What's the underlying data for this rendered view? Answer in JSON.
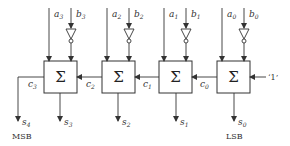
{
  "diagram": {
    "type": "4-bit ripple adder/subtractor (a + NOT b + 1)",
    "adders": [
      {
        "symbol": "Σ",
        "a": "a",
        "a_sub": "3",
        "b": "b",
        "b_sub": "3",
        "sum": "s",
        "sum_sub": "3",
        "carry_out": "c",
        "carry_out_sub": "3"
      },
      {
        "symbol": "Σ",
        "a": "a",
        "a_sub": "2",
        "b": "b",
        "b_sub": "2",
        "sum": "s",
        "sum_sub": "2",
        "carry_out": "c",
        "carry_out_sub": "2"
      },
      {
        "symbol": "Σ",
        "a": "a",
        "a_sub": "1",
        "b": "b",
        "b_sub": "1",
        "sum": "s",
        "sum_sub": "1",
        "carry_out": "c",
        "carry_out_sub": "1"
      },
      {
        "symbol": "Σ",
        "a": "a",
        "a_sub": "0",
        "b": "b",
        "b_sub": "0",
        "sum": "s",
        "sum_sub": "0",
        "carry_out": "c",
        "carry_out_sub": "0"
      }
    ],
    "carry_in": "‘1’",
    "final_output": {
      "name": "s",
      "sub": "4"
    },
    "msb_label": "MSB",
    "lsb_label": "LSB"
  }
}
